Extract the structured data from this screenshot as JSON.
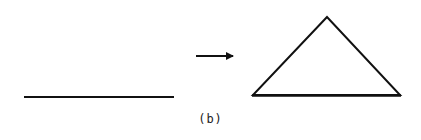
{
  "figure": {
    "caption": "(b)",
    "stroke_color": "#111111",
    "background": "#ffffff"
  },
  "elements": {
    "line_segment": {
      "x1": 24,
      "y1": 97,
      "x2": 174,
      "y2": 97
    },
    "arrow": {
      "x1": 196,
      "y1": 56,
      "x2": 233,
      "y2": 56,
      "direction": "right"
    },
    "triangle": {
      "points": [
        [
          327,
          17
        ],
        [
          253,
          95
        ],
        [
          400,
          95
        ]
      ]
    }
  }
}
